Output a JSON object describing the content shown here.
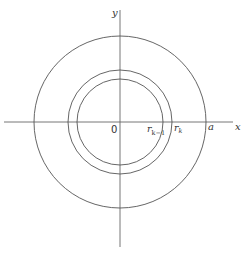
{
  "diagram": {
    "type": "concentric-circles",
    "center": {
      "x": 120,
      "y": 122
    },
    "axes": {
      "x_label": "x",
      "y_label": "y",
      "origin_label": "0"
    },
    "circles": [
      {
        "name": "inner",
        "radius": 43,
        "label": "r",
        "subscript": "k−1"
      },
      {
        "name": "middle",
        "radius": 52,
        "label": "r",
        "subscript": "k"
      },
      {
        "name": "outer",
        "radius": 86,
        "label": "a",
        "subscript": ""
      }
    ],
    "stroke_color": "#555555"
  }
}
